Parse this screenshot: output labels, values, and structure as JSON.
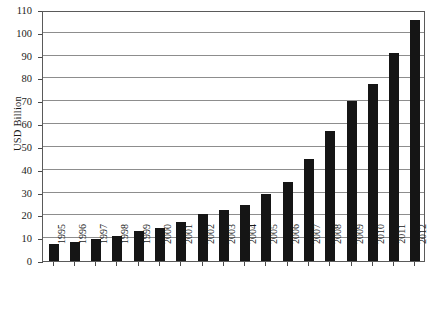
{
  "chart_data": {
    "type": "bar",
    "title": "",
    "subtitle": "",
    "xlabel": "",
    "ylabel": "USD Billion",
    "ylim": [
      0,
      110
    ],
    "ytick_step": 10,
    "yticks": [
      0,
      10,
      20,
      30,
      40,
      50,
      60,
      70,
      80,
      90,
      100,
      110
    ],
    "grid": true,
    "legend": false,
    "legend_position": "none",
    "bar_color": "#151515",
    "gridline_color": "#8d8d8d",
    "axis_color": "#5a5a5a",
    "background": "#ffffff",
    "categories": [
      "1995",
      "1996",
      "1997",
      "1998",
      "1999",
      "2000",
      "2001",
      "2002",
      "2003",
      "2004",
      "2005",
      "2006",
      "2007",
      "2008",
      "2009",
      "2010",
      "2011",
      "2012"
    ],
    "values": [
      7.5,
      8.5,
      9.5,
      11,
      13,
      14.5,
      17,
      20.5,
      22.5,
      24.5,
      29.5,
      34.5,
      44.5,
      57,
      70,
      77.5,
      91,
      105.5
    ],
    "annotations": []
  },
  "caption": {
    "text": ""
  }
}
